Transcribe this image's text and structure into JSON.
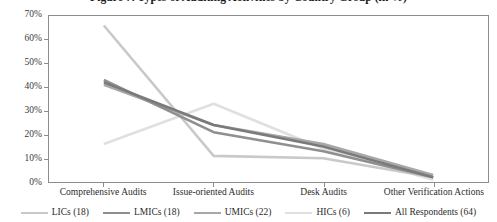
{
  "chart_data": {
    "type": "line",
    "title": "Figure 7. Types of Auditing Activities by Country Group (in %)",
    "xlabel": "",
    "ylabel": "",
    "ylim": [
      0,
      70
    ],
    "ytick_labels": [
      "70%",
      "60%",
      "50%",
      "40%",
      "30%",
      "20%",
      "10%",
      "0%"
    ],
    "ytick_values": [
      70,
      60,
      50,
      40,
      30,
      20,
      10,
      0
    ],
    "grid": false,
    "legend_position": "bottom",
    "categories": [
      "Comprehensive Audits",
      "Issue-oriented Audits",
      "Desk Audits",
      "Other Verification Actions"
    ],
    "series": [
      {
        "name": "LICs (18)",
        "values": [
          66,
          11,
          10,
          2
        ],
        "color": "#c9c9c9"
      },
      {
        "name": "LMICs (18)",
        "values": [
          43,
          21,
          13,
          2
        ],
        "color": "#8f8f8f"
      },
      {
        "name": "UMICs (22)",
        "values": [
          41,
          24,
          16,
          3
        ],
        "color": "#a8a8a8"
      },
      {
        "name": "HICs (6)",
        "values": [
          16,
          33,
          14,
          1
        ],
        "color": "#e0e0e0"
      },
      {
        "name": "All Respondents (64)",
        "values": [
          42,
          24,
          15,
          2
        ],
        "color": "#7a7a7a"
      }
    ]
  },
  "axis": {
    "frame_color": "#8c8c8c"
  }
}
